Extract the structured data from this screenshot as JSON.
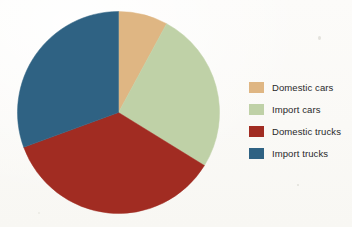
{
  "chart_data": {
    "type": "pie",
    "title": "",
    "subtitle": "",
    "xlabel": "",
    "ylabel": "",
    "legend_position": "right",
    "grid": false,
    "start_angle_deg": 0,
    "direction": "clockwise",
    "categories": [
      "Domestic cars",
      "Import cars",
      "Domestic trucks",
      "Import trucks"
    ],
    "values": [
      7.9,
      25.9,
      35.6,
      30.6
    ],
    "value_unit": "percent",
    "slice_angles_deg": [
      28.3,
      93.4,
      128.3,
      110.0
    ],
    "colors": [
      "#dfb683",
      "#bfd1a7",
      "#a12c22",
      "#2f6283"
    ],
    "slices": [
      {
        "label": "Domestic cars",
        "value": 7.9,
        "angle_deg": 28.3,
        "color": "#dfb683"
      },
      {
        "label": "Import cars",
        "value": 25.9,
        "angle_deg": 93.4,
        "color": "#bfd1a7"
      },
      {
        "label": "Domestic trucks",
        "value": 35.6,
        "angle_deg": 128.3,
        "color": "#a12c22"
      },
      {
        "label": "Import trucks",
        "value": 30.6,
        "angle_deg": 110.0,
        "color": "#2f6283"
      }
    ]
  },
  "legend": {
    "items": [
      {
        "label": "Domestic cars",
        "color": "#dfb683"
      },
      {
        "label": "Import cars",
        "color": "#bfd1a7"
      },
      {
        "label": "Domestic trucks",
        "color": "#a12c22"
      },
      {
        "label": "Import trucks",
        "color": "#2f6283"
      }
    ]
  },
  "canvas": {
    "background": "#fbfaf7",
    "pie_center_x": 118.5,
    "pie_center_y": 112.5,
    "pie_radius": 101
  }
}
